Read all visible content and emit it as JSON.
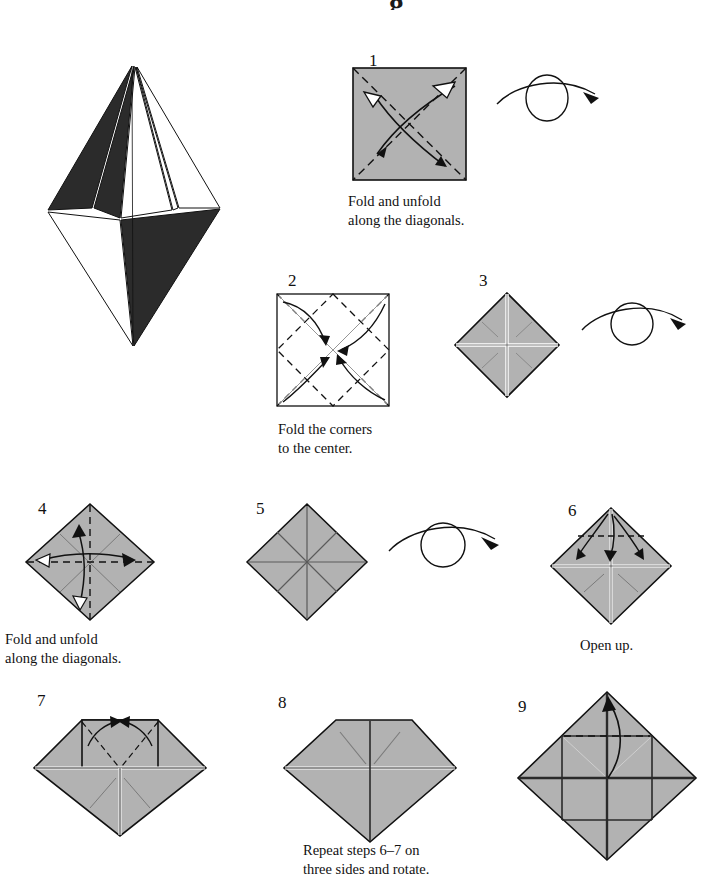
{
  "document": {
    "type": "origami-instruction-diagram",
    "title_fragment": "g",
    "background": "#ffffff",
    "ink": "#111111",
    "paper_gray": "#b2b2b2",
    "paper_gray_dark": "#9a9a9a",
    "paper_white": "#ffffff",
    "paper_black": "#2b2b2b"
  },
  "finished_model": {
    "name": "finished-model",
    "description": "Completed folded bipyramid / crystal model shown in black-and-white shading"
  },
  "symbols": {
    "turn_over": "turn-over-arrow",
    "valley_fold": "dashed-line",
    "fold_arrow": "curved-arrow",
    "unfold_arrow": "hollow-head-arrow"
  },
  "steps": [
    {
      "number": "1",
      "caption": "Fold and unfold\nalong the diagonals.",
      "shape": "square",
      "fill": "gray",
      "has_turn_over": true,
      "creases": "both diagonals, dashed",
      "arrows": "two crossing curved fold-and-unfold arrows"
    },
    {
      "number": "2",
      "caption": "Fold the corners\nto the center.",
      "shape": "square",
      "fill": "white",
      "has_turn_over": false,
      "creases": "inscribed diamond, dashed",
      "arrows": "four curved arrows pointing to the center"
    },
    {
      "number": "3",
      "caption": "",
      "shape": "diamond",
      "fill": "gray",
      "has_turn_over": true,
      "creases": "white cross and four corner creases",
      "arrows": "none"
    },
    {
      "number": "4",
      "caption": "Fold and unfold\nalong the diagonals.",
      "shape": "diamond",
      "fill": "gray",
      "has_turn_over": false,
      "creases": "horizontal and vertical dashed lines",
      "arrows": "two double-headed curved fold-and-unfold arrows"
    },
    {
      "number": "5",
      "caption": "",
      "shape": "diamond",
      "fill": "gray",
      "has_turn_over": true,
      "creases": "eight radiating crease lines",
      "arrows": "none"
    },
    {
      "number": "6",
      "caption": "Open up.",
      "shape": "diamond",
      "fill": "gray",
      "has_turn_over": false,
      "creases": "cross plus dashed horizontal line in upper quarter",
      "arrows": "three curved arrows opening the top flap"
    },
    {
      "number": "7",
      "caption": "",
      "shape": "diamond-with-open-flap",
      "fill": "gray",
      "has_turn_over": false,
      "creases": "rectangular opened flap with dashed diagonals",
      "arrows": "two curved arrows meeting at the top center"
    },
    {
      "number": "8",
      "caption": "Repeat steps 6–7 on\nthree sides and rotate.",
      "shape": "diamond-with-flattened-top",
      "fill": "gray",
      "has_turn_over": false,
      "creases": "center cross and two diagonal creases",
      "arrows": "none"
    },
    {
      "number": "9",
      "caption": "",
      "shape": "diamond-four-panels",
      "fill": "gray",
      "has_turn_over": false,
      "creases": "four square panels, dashed line across upper panel",
      "arrows": "one curved arrow folding the top panel upward"
    }
  ]
}
